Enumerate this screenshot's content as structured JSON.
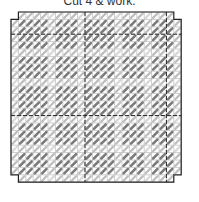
{
  "caption": "Cut 4 & work.",
  "chart_data": {
    "type": "diagram",
    "title": "Cut 4 & work.",
    "grid": {
      "cols": 23,
      "rows": 23,
      "cell_size": 7.4,
      "origin_x": 11,
      "origin_y": 12,
      "notch_cells": 1,
      "dashed_cols": [
        10,
        21
      ],
      "dashed_rows": [
        3,
        14
      ]
    },
    "colors": {
      "dark_stitch": "#7a7a7a",
      "light_stitch": "#bdbdbd",
      "grid_line": "#9a9a9a",
      "border": "#222222"
    },
    "dark_row_bands": [
      [
        1,
        4
      ],
      [
        6,
        8
      ],
      [
        10,
        13
      ],
      [
        15,
        17
      ],
      [
        19,
        21
      ]
    ],
    "dark_col_bands": [
      [
        1,
        4
      ],
      [
        6,
        8
      ],
      [
        10,
        13
      ],
      [
        15,
        17
      ],
      [
        19,
        21
      ]
    ],
    "legend": []
  }
}
